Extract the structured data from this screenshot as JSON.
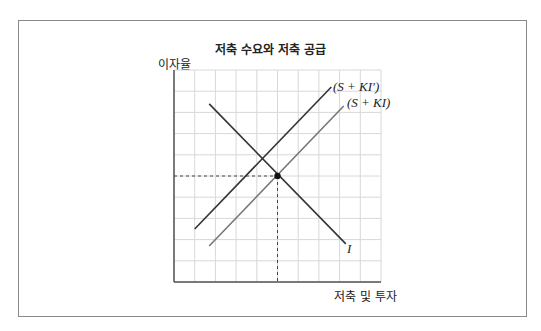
{
  "chart_data": {
    "type": "line",
    "title": "저축 수요와 저축 공급",
    "xlabel": "저축 및 투자",
    "ylabel": "이자율",
    "grid": true,
    "grid_divisions": {
      "x": 10,
      "y": 10
    },
    "xlim": [
      0,
      10
    ],
    "ylim": [
      0,
      10
    ],
    "ticks_labeled": false,
    "series": [
      {
        "name": "I",
        "label": "I",
        "points": [
          [
            1.7,
            8.4
          ],
          [
            8.3,
            1.8
          ]
        ],
        "color": "#333333"
      },
      {
        "name": "S + KI′",
        "label": "(S + KI′)",
        "points": [
          [
            1.0,
            2.5
          ],
          [
            7.6,
            9.2
          ]
        ],
        "color": "#333333"
      },
      {
        "name": "S + KI",
        "label": "(S + KI)",
        "points": [
          [
            1.7,
            1.7
          ],
          [
            8.2,
            8.3
          ]
        ],
        "color": "#777777"
      }
    ],
    "annotations": [
      {
        "type": "point",
        "x": 5.0,
        "y": 5.0,
        "description": "equilibrium of I and S + KI"
      },
      {
        "type": "dashed-guides",
        "x": 5.0,
        "y": 5.0
      }
    ]
  },
  "labels": {
    "title": "저축 수요와 저축 공급",
    "ylabel": "이자율",
    "xlabel": "저축 및 투자",
    "curve_i": "I",
    "curve_ski_prime": "(S + KI′)",
    "curve_ski": "(S + KI)"
  }
}
